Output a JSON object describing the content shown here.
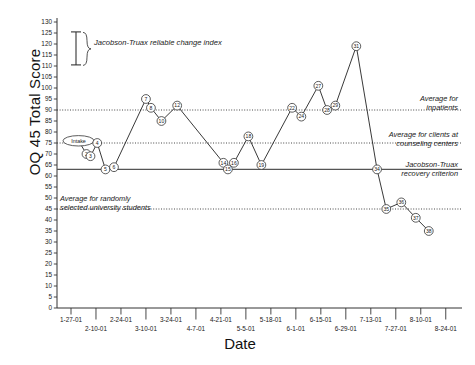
{
  "chart_data": {
    "type": "line",
    "title": "",
    "xlabel": "Date",
    "ylabel": "OQ 45 Total Score",
    "ylim": [
      0,
      130
    ],
    "ytick_step": 5,
    "yticks": [
      0,
      5,
      10,
      15,
      20,
      25,
      30,
      35,
      40,
      45,
      50,
      55,
      60,
      65,
      70,
      75,
      80,
      85,
      90,
      95,
      100,
      105,
      110,
      115,
      120,
      125,
      130
    ],
    "grid": false,
    "legend_position": "top-left",
    "x_tick_labels": [
      "1-27-01",
      "2-10-01",
      "2-24-01",
      "3-10-01",
      "3-24-01",
      "4-7-01",
      "4-21-01",
      "5-5-01",
      "5-18-01",
      "6-1-01",
      "6-15-01",
      "6-29-01",
      "7-13-01",
      "7-27-01",
      "8-10-01",
      "8-24-01"
    ],
    "series": [
      {
        "name": "OQ 45 Total Score",
        "point_labels": [
          "Intake",
          "2",
          "3",
          "4",
          "5",
          "6",
          "7",
          "8",
          "10",
          "12",
          "14",
          "15",
          "16",
          "18",
          "19",
          "22",
          "24",
          "27",
          "28",
          "29",
          "31",
          "34",
          "35",
          "36",
          "37",
          "38"
        ],
        "values": [
          76,
          70,
          69,
          75,
          63,
          64,
          95,
          91,
          85,
          92,
          66,
          63,
          66,
          78,
          65,
          91,
          87,
          101,
          90,
          92,
          119,
          63,
          45,
          48,
          41,
          35
        ]
      }
    ],
    "reference_lines": [
      {
        "label": "Average for inpatients",
        "value": 90,
        "style": "dotted"
      },
      {
        "label": "Average for clients at counseling centers",
        "value": 75,
        "style": "dotted"
      },
      {
        "label": "Jacobson-Truax recovery criterion",
        "value": 63,
        "style": "solid"
      },
      {
        "label": "Average for randomly selected university students",
        "value": 45,
        "style": "dotted"
      }
    ],
    "legend": {
      "label": "Jacobson-Truax reliable change index",
      "marker": "error-bar"
    }
  },
  "annotations": {
    "inpatients_line1": "Average for",
    "inpatients_line2": "inpatients",
    "counseling_line1": "Average for clients at",
    "counseling_line2": "counseling  centers",
    "recovery_line1": "Jacobson-Truax",
    "recovery_line2": "recovery criterion",
    "university_line1": "Average for randomly",
    "university_line2": "selected university students",
    "legend_label": "Jacobson-Truax reliable change index"
  },
  "axes": {
    "ylabel": "OQ 45 Total Score",
    "xlabel": "Date"
  }
}
